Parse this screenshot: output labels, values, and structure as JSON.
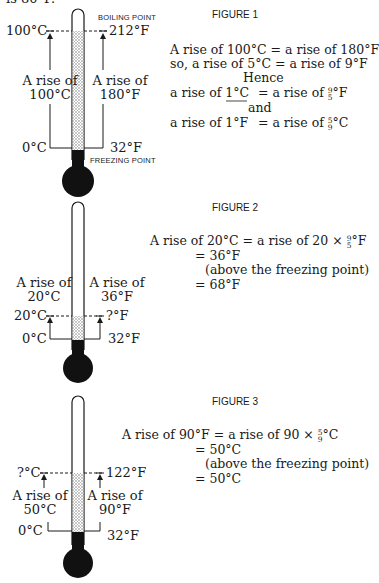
{
  "top_cut_text": "is 80°F.",
  "figure1": {
    "title": "FIGURE 1",
    "boiling_label": "BOILING POINT",
    "freezing_label": "FREEZING POINT",
    "c_top": "100°C",
    "c_bottom": "0°C",
    "f_top": "212°F",
    "f_bottom": "32°F",
    "rise_c_line1": "A rise of",
    "rise_c_line2": "100°C",
    "rise_f_line1": "A rise of",
    "rise_f_line2": "180°F",
    "eq1": "A rise of 100°C  = a rise of 180°F",
    "eq2": "so, a rise of 5°C = a rise of 9°F",
    "eq3": "Hence",
    "eq4_left": "a rise of 1°C",
    "eq4_right": "= a rise of",
    "eq4_num": "9",
    "eq4_den": "5",
    "eq4_unit": "°F",
    "eq5": "and",
    "eq6_left": "a rise of 1°F",
    "eq6_right": "= a rise of",
    "eq6_num": "5",
    "eq6_den": "9",
    "eq6_unit": "°C"
  },
  "figure2": {
    "title": "FIGURE 2",
    "rise_c_line1": "A rise of",
    "rise_c_line2": "20°C",
    "rise_f_line1": "A rise of",
    "rise_f_line2": "36°F",
    "c_top": "20°C",
    "c_bottom": "0°C",
    "f_top": "?°F",
    "f_bottom": "32°F",
    "eq1_left": "A rise of 20°C = a rise of 20 ×",
    "eq1_num": "9",
    "eq1_den": "5",
    "eq1_unit": "°F",
    "eq2": "= 36°F",
    "eq3": "(above the freezing point)",
    "eq4": "= 68°F"
  },
  "figure3": {
    "title": "FIGURE 3",
    "rise_c_line1": "A rise of",
    "rise_c_line2": "50°C",
    "rise_f_line1": "A rise of",
    "rise_f_line2": "90°F",
    "c_top": "?°C",
    "c_bottom": "0°C",
    "f_top": "122°F",
    "f_bottom": "32°F",
    "eq1_left": "A rise of 90°F = a rise of 90 ×",
    "eq1_num": "5",
    "eq1_den": "9",
    "eq1_unit": "°C",
    "eq2": "= 50°C",
    "eq3": "(above the freezing point)",
    "eq4": "= 50°C"
  },
  "colors": {
    "ink": "#1a1a1a",
    "mercury": "#111111",
    "dots": "#777777"
  }
}
